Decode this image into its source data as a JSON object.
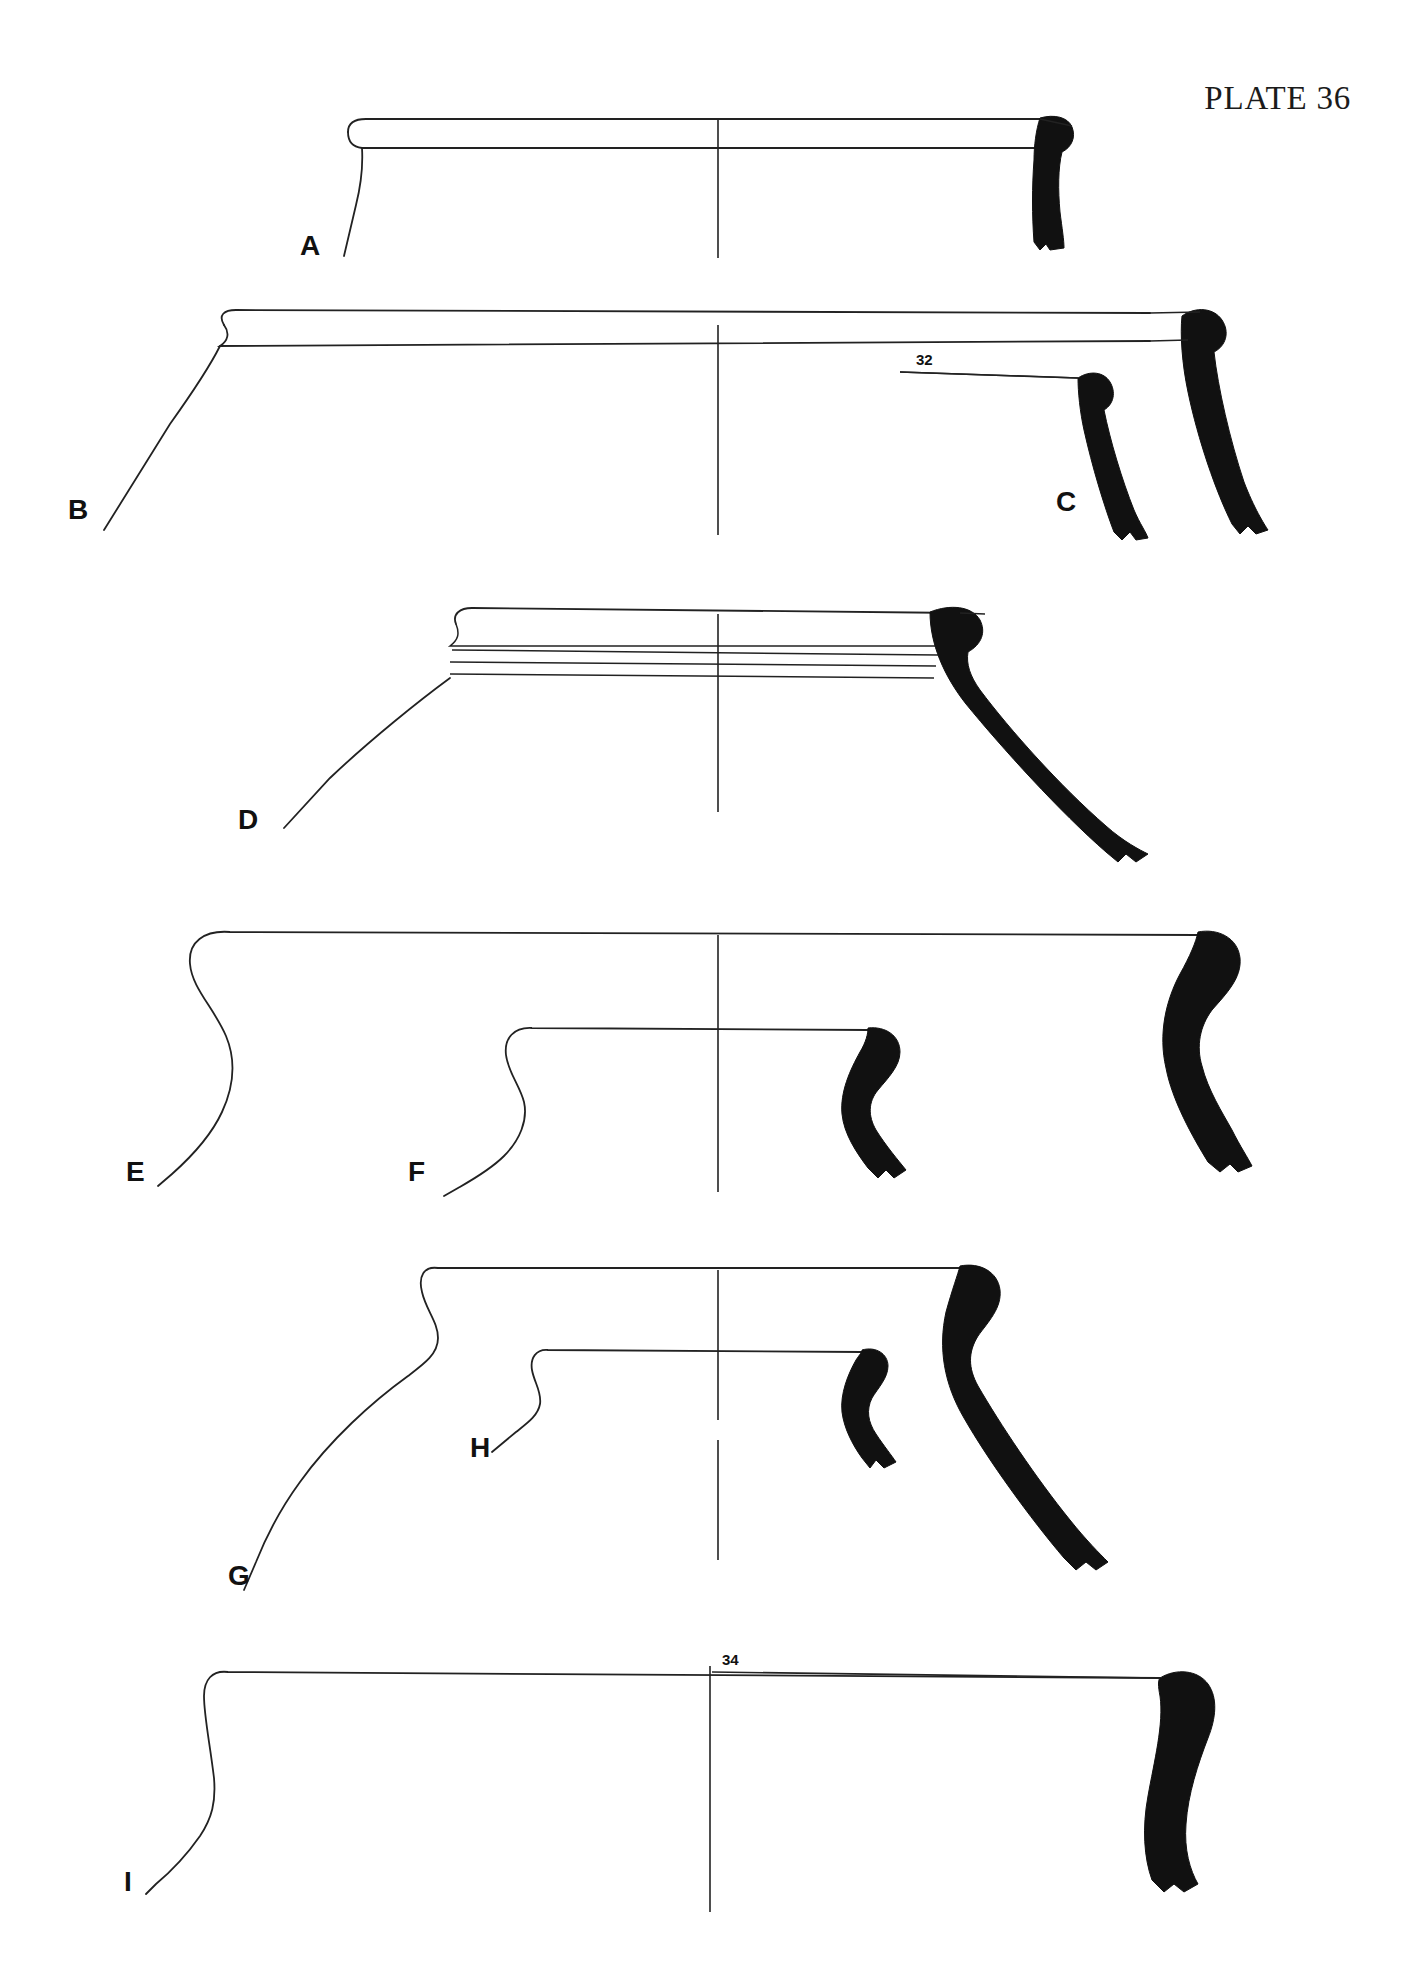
{
  "plate": {
    "title": "PLATE 36",
    "ink_color": "#111111",
    "paper_color": "#ffffff",
    "section_fill": "#111111",
    "width": 1413,
    "height": 1972
  },
  "figures": [
    {
      "id": "A",
      "label": "A",
      "label_x": 300,
      "label_y": 232,
      "description": "shallow dish with flattened flanged rim",
      "row": 1
    },
    {
      "id": "B",
      "label": "B",
      "label_x": 68,
      "label_y": 510,
      "description": "wide open bowl with everted beaded rim",
      "row": 2
    },
    {
      "id": "C",
      "label": "C",
      "label_x": 1062,
      "label_y": 492,
      "description": "rim sherd section, everted beaded rim",
      "row": 2
    },
    {
      "id": "D",
      "label": "D",
      "label_x": 240,
      "label_y": 818,
      "description": "bowl with rolled rim and horizontal grooves below rim",
      "row": 3
    },
    {
      "id": "E",
      "label": "E",
      "label_x": 128,
      "label_y": 1165,
      "description": "large bowl with S-profile rim and concave neck",
      "row": 4
    },
    {
      "id": "F",
      "label": "F",
      "label_x": 408,
      "label_y": 1165,
      "description": "smaller bowl with S-profile rim",
      "row": 4
    },
    {
      "id": "G",
      "label": "G",
      "label_x": 230,
      "label_y": 1574,
      "description": "jar with rolled rim and concave neck, sloping shoulder",
      "row": 5
    },
    {
      "id": "H",
      "label": "H",
      "label_x": 472,
      "label_y": 1440,
      "description": "small jar with short everted rim",
      "row": 5
    },
    {
      "id": "I",
      "label": "I",
      "label_x": 124,
      "label_y": 1876,
      "description": "large vessel with sharply turned rim and vertical neck",
      "row": 6
    }
  ],
  "annotations": [
    {
      "id": "ann-32",
      "text": "32",
      "x": 916,
      "y": 354,
      "leader_x1": 900,
      "leader_y1": 372,
      "leader_x2": 1078,
      "leader_y2": 378
    },
    {
      "id": "ann-34",
      "text": "34",
      "x": 722,
      "y": 1653,
      "leader_x1": 712,
      "leader_y1": 1672,
      "leader_x2": 1160,
      "leader_y2": 1678
    }
  ]
}
